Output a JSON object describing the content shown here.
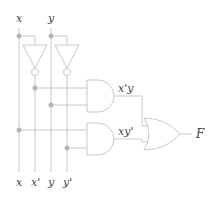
{
  "diagram": {
    "title": "",
    "inputs": {
      "x": "x",
      "y": "y"
    },
    "bottom_labels": [
      "x",
      "x'",
      "y",
      "y'"
    ],
    "and_gate_1_output": "x'y",
    "and_gate_2_output": "xy'",
    "output_label": "F",
    "colors": {
      "wire": "#c8c8c8",
      "dot": "#b4b4b4",
      "text": "#444444"
    }
  }
}
